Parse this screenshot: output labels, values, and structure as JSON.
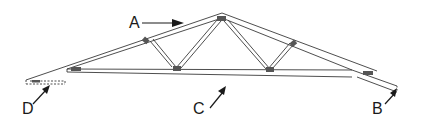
{
  "diagram": {
    "type": "roof truss",
    "labels": {
      "a": "A",
      "b": "B",
      "c": "C",
      "d": "D"
    },
    "colors": {
      "line": "#3a3a3a",
      "plate": "#555555",
      "background": "#ffffff"
    }
  }
}
